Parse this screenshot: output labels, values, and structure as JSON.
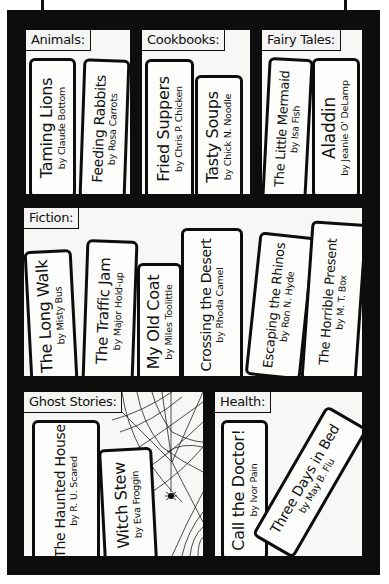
{
  "shelves": [
    {
      "label": "Animals:",
      "books": [
        {
          "title": "Taming Lions",
          "author": "by Claude Bottom"
        },
        {
          "title": "Feeding Rabbits",
          "author": "by Rosa Carrots"
        }
      ]
    },
    {
      "label": "Cookbooks:",
      "books": [
        {
          "title": "Fried Suppers",
          "author": "by Chris P. Chicken"
        },
        {
          "title": "Tasty Soups",
          "author": "by Chick N. Noodle"
        }
      ]
    },
    {
      "label": "Fairy Tales:",
      "books": [
        {
          "title": "The Little Mermaid",
          "author": "by Isa Fish"
        },
        {
          "title": "Aladdin",
          "author": "by Jeanie O' DeLamp"
        }
      ]
    },
    {
      "label": "Fiction:",
      "books": [
        {
          "title": "The Long Walk",
          "author": "by Misty Bus"
        },
        {
          "title": "The Traffic Jam",
          "author": "by Major Hold-up"
        },
        {
          "title": "My Old Coat",
          "author": "by Miles Toolittle"
        },
        {
          "title": "Crossing the Desert",
          "author": "by Rhoda Camel"
        },
        {
          "title": "Escaping the Rhinos",
          "author": "by Ron N. Hyde"
        },
        {
          "title": "The Horrible Present",
          "author": "by M. T. Box"
        }
      ]
    },
    {
      "label": "Ghost Stories:",
      "books": [
        {
          "title": "The Haunted House",
          "author": "by R. U. Scared"
        },
        {
          "title": "Witch Stew",
          "author": "by Eva Froggin"
        }
      ]
    },
    {
      "label": "Health:",
      "books": [
        {
          "title": "Call the Doctor!",
          "author": "by Ivor Pain"
        },
        {
          "title": "Three Days in Bed",
          "author": "by May B. Flu"
        }
      ]
    }
  ],
  "icons": [
    "spider-web-icon",
    "spider-icon"
  ],
  "colors": {
    "frame": "#0d0d0d",
    "shelf_bg": "#f7f7f5",
    "book_bg": "#fdfdfb"
  }
}
